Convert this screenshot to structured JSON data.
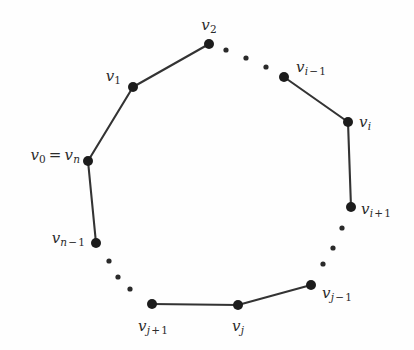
{
  "figure": {
    "type": "graph-diagram",
    "width": 414,
    "height": 350,
    "background_color": "#fefefe",
    "edge_color": "#333333",
    "vertex_color": "#1c1c1c",
    "label_color": "#2b2b2b",
    "edge_width": 2.1,
    "vertex_radius": 5,
    "dot_radius": 2.6
  },
  "vertices": [
    {
      "id": "v0",
      "label_v": "v",
      "label_sub": "0",
      "x": 88,
      "y": 161,
      "label_x": 80,
      "label_y": 155,
      "anchor": "right",
      "label_kind": "equality"
    },
    {
      "id": "v1",
      "label_v": "v",
      "label_sub": "1",
      "x": 133,
      "y": 87,
      "label_x": 119,
      "label_y": 77,
      "anchor": "right",
      "label_kind": "plain"
    },
    {
      "id": "v2",
      "label_v": "v",
      "label_sub": "2",
      "x": 209,
      "y": 44,
      "label_x": 209,
      "label_y": 25,
      "anchor": "center",
      "label_kind": "plain"
    },
    {
      "id": "vi_minus_1",
      "label_v": "v",
      "label_sub": "i",
      "x": 284,
      "y": 77,
      "label_x": 296,
      "label_y": 67,
      "anchor": "left",
      "label_kind": "minus"
    },
    {
      "id": "vi",
      "label_v": "v",
      "label_sub": "i",
      "x": 348,
      "y": 122,
      "label_x": 359,
      "label_y": 122,
      "anchor": "left",
      "label_kind": "plain"
    },
    {
      "id": "vi_plus_1",
      "label_v": "v",
      "label_sub": "i",
      "x": 351,
      "y": 207,
      "label_x": 361,
      "label_y": 209,
      "anchor": "left",
      "label_kind": "plus"
    },
    {
      "id": "vj_minus_1",
      "label_v": "v",
      "label_sub": "j",
      "x": 311,
      "y": 285,
      "label_x": 322,
      "label_y": 292,
      "anchor": "left",
      "label_kind": "minus"
    },
    {
      "id": "vj",
      "label_v": "v",
      "label_sub": "j",
      "x": 238,
      "y": 305,
      "label_x": 238,
      "label_y": 326,
      "anchor": "center",
      "label_kind": "plain"
    },
    {
      "id": "vj_plus_1",
      "label_v": "v",
      "label_sub": "j",
      "x": 152,
      "y": 304,
      "label_x": 152,
      "label_y": 326,
      "anchor": "center",
      "label_kind": "plus"
    },
    {
      "id": "vn_minus_1",
      "label_v": "v",
      "label_sub": "n",
      "x": 96,
      "y": 243,
      "label_x": 85,
      "label_y": 238,
      "anchor": "right",
      "label_kind": "minus"
    }
  ],
  "labels": {
    "v0_equals_vn": {
      "text": "v0 = vn",
      "base": "v",
      "sub1": "0",
      "equals": "=",
      "base2": "v",
      "sub2": "n"
    },
    "v1": {
      "text": "v1"
    },
    "v2": {
      "text": "v2"
    },
    "vi_minus_1": {
      "text": "vi-1"
    },
    "vi": {
      "text": "vi"
    },
    "vi_plus_1": {
      "text": "vi+1"
    },
    "vj_minus_1": {
      "text": "vj-1"
    },
    "vj": {
      "text": "vj"
    },
    "vj_plus_1": {
      "text": "vj+1"
    },
    "vn_minus_1": {
      "text": "vn-1"
    },
    "minus_sign": "−",
    "plus_sign": "+",
    "equals_sign": "="
  },
  "edges": [
    {
      "from": "v0",
      "to": "v1",
      "x1": 88,
      "y1": 161,
      "x2": 133,
      "y2": 87
    },
    {
      "from": "v1",
      "to": "v2",
      "x1": 133,
      "y1": 87,
      "x2": 209,
      "y2": 44
    },
    {
      "from": "vi_minus_1",
      "to": "vi",
      "x1": 284,
      "y1": 77,
      "x2": 348,
      "y2": 122
    },
    {
      "from": "vi",
      "to": "vi_plus_1",
      "x1": 348,
      "y1": 122,
      "x2": 351,
      "y2": 207
    },
    {
      "from": "vj_minus_1",
      "to": "vj",
      "x1": 311,
      "y1": 285,
      "x2": 238,
      "y2": 305
    },
    {
      "from": "vj",
      "to": "vj_plus_1",
      "x1": 238,
      "y1": 305,
      "x2": 152,
      "y2": 304
    },
    {
      "from": "vn_minus_1",
      "to": "v0",
      "x1": 96,
      "y1": 243,
      "x2": 88,
      "y2": 161
    }
  ],
  "ellipsis_dots": [
    {
      "arc": "v2-to-vi_minus_1",
      "x": 226,
      "y": 50
    },
    {
      "arc": "v2-to-vi_minus_1",
      "x": 246,
      "y": 58
    },
    {
      "arc": "v2-to-vi_minus_1",
      "x": 266,
      "y": 67
    },
    {
      "arc": "vi_plus_1-to-vj_minus_1",
      "x": 342,
      "y": 228
    },
    {
      "arc": "vi_plus_1-to-vj_minus_1",
      "x": 333,
      "y": 248
    },
    {
      "arc": "vi_plus_1-to-vj_minus_1",
      "x": 323,
      "y": 264
    },
    {
      "arc": "vn_minus_1-to-vj_plus_1",
      "x": 109,
      "y": 261
    },
    {
      "arc": "vn_minus_1-to-vj_plus_1",
      "x": 118,
      "y": 277
    },
    {
      "arc": "vn_minus_1-to-vj_plus_1",
      "x": 130,
      "y": 289
    }
  ]
}
